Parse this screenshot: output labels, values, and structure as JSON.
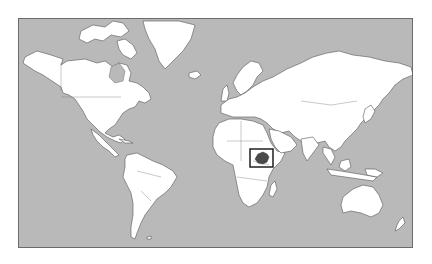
{
  "map": {
    "projection": "mercator-world",
    "colors": {
      "ocean": "#b9b9b9",
      "land": "#ffffff",
      "coastline": "#555555",
      "highlight": "#4a4a4a",
      "highlight_box": "#111111",
      "frame": "#6b6b6b"
    },
    "highlighted_region": {
      "name": "Ethiopia",
      "icon": "locator-box"
    }
  }
}
